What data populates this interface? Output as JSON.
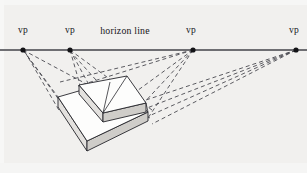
{
  "figure": {
    "kind": "perspective-construction-diagram",
    "background_color": "#f1f0ee",
    "ink_color": "#1b1b1f",
    "width": 307,
    "height": 173
  },
  "horizon": {
    "caption": "horizon line",
    "caption_x": 125,
    "caption_y": 31,
    "y": 50,
    "x_start": 0,
    "x_end": 307,
    "color": "#6e6e72",
    "thickness": 2
  },
  "vanishing_points": [
    {
      "label": "vp",
      "x": 23,
      "y": 50,
      "label_x": 23,
      "label_y": 31
    },
    {
      "label": "vp",
      "x": 70,
      "y": 50,
      "label_x": 70,
      "label_y": 31
    },
    {
      "label": "vp",
      "x": 193,
      "y": 50,
      "label_x": 191,
      "label_y": 31
    },
    {
      "label": "vp",
      "x": 296,
      "y": 50,
      "label_x": 294,
      "label_y": 31
    }
  ],
  "solid_shape": {
    "description": "two-tier stepped wedge block in multi-point perspective",
    "fill_top": "#fdfdfc",
    "fill_side": "#d9d8d5",
    "fill_front": "#eceae7",
    "stroke": "#25252a",
    "stroke_width": 0.9
  },
  "construction_lines": {
    "style": "dashed",
    "dash_pattern": "4 3",
    "color": "#4a4a50",
    "width": 0.9
  },
  "geometry": {
    "lower_slab": {
      "top_face": "58,97 109,82 147,111 87,141",
      "left_face": "58,97 87,141 87,150 58,106",
      "front_face": "87,141 147,111 147,120 87,150"
    },
    "upper_slab": {
      "top_face": "79,85 126,76 146,104 102,113",
      "left_face": "79,85 102,113 102,121 79,93",
      "front_face": "102,113 146,104 146,112 102,121"
    }
  }
}
